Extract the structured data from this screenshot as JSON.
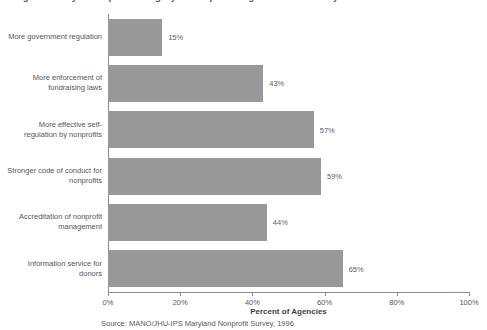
{
  "chart_data": {
    "type": "bar",
    "orientation": "horizontal",
    "title": "Figure 4: Ways to Improve Integrity of Nonprofit Organizations in Maryland",
    "categories": [
      "More government regulation",
      "More enforcement of\nfundraising laws",
      "More effective self-regulation\nby nonprofits",
      "Stronger code of conduct for\nnonprofits",
      "Accreditation of nonprofit\nmanagement",
      "Information service for\ndonors"
    ],
    "values": [
      15,
      43,
      57,
      59,
      44,
      65
    ],
    "value_labels": [
      "15%",
      "43%",
      "57%",
      "59%",
      "44%",
      "65%"
    ],
    "xlabel": "Percent of Agencies",
    "ylabel": "",
    "xlim": [
      0,
      100
    ],
    "xticks": [
      0,
      20,
      40,
      60,
      80,
      100
    ],
    "xtick_labels": [
      "0%",
      "20%",
      "40%",
      "60%",
      "80%",
      "100%"
    ],
    "grid": false,
    "legend": false,
    "bar_color": "#999999",
    "axis_color": "#8a8a92",
    "text_color": "#55555d",
    "background": "#ffffff"
  },
  "source": {
    "note": "Source: MANO/JHU-IPS Maryland Nonprofit Survey, 1996"
  }
}
